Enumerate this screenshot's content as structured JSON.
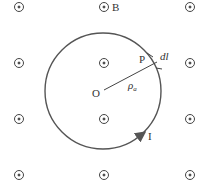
{
  "diagram": {
    "field_label": "B",
    "center_label": "O",
    "point_label": "P",
    "element_label": "dl",
    "radius_label": "ρ",
    "radius_subscript": "a",
    "current_label": "I",
    "colors": {
      "stroke": "#555555",
      "text": "#333333",
      "background": "#ffffff"
    },
    "field_symbol": "dot-in-circle (out of page)",
    "field_grid": {
      "columns": [
        19,
        104,
        190
      ],
      "rows": [
        7,
        63,
        119,
        175
      ]
    }
  }
}
